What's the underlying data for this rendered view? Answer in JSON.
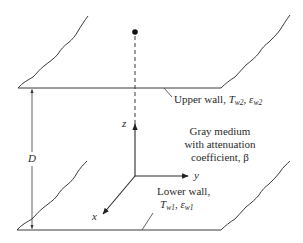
{
  "diagram": {
    "title": "",
    "upper_wall": {
      "label": "Upper wall,",
      "temp_symbol": "T",
      "temp_sub": "w2",
      "emis_symbol": "ε",
      "emis_sub": "w2"
    },
    "lower_wall": {
      "label": "Lower wall,",
      "temp_symbol": "T",
      "temp_sub": "w1",
      "emis_symbol": "ε",
      "emis_sub": "w1"
    },
    "medium": {
      "line1": "Gray medium",
      "line2": "with attenuation",
      "line3": "coefficient, β"
    },
    "axes": {
      "x": "x",
      "y": "y",
      "z": "z"
    },
    "dimension": {
      "label": "D"
    },
    "colors": {
      "line": "#3a3a3a",
      "text": "#2a2a2a",
      "background": "#ffffff"
    }
  }
}
